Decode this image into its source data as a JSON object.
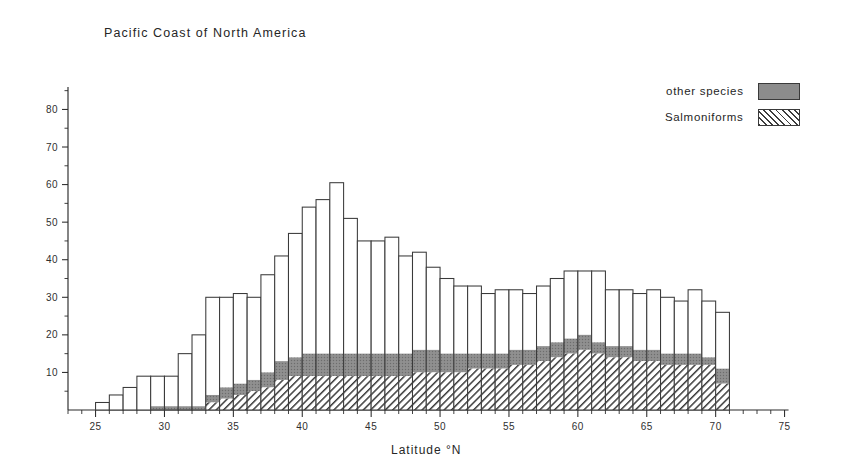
{
  "chart": {
    "title": "Pacific Coast of North America",
    "xlabel": "Latitude  °N",
    "ylabel": ""
  },
  "legend": {
    "position": "top-right",
    "items": [
      {
        "label": "other species",
        "swatch": "gray-solid-swatch",
        "color": "#8c8c8c"
      },
      {
        "label": "Salmoniforms",
        "swatch": "diagonal-hatch-swatch",
        "color": "#3c3c3c"
      }
    ]
  },
  "axes": {
    "x": {
      "min": 23,
      "max": 75,
      "tick_labels": [
        "25",
        "30",
        "35",
        "40",
        "45",
        "50",
        "55",
        "60",
        "65",
        "70",
        "75"
      ],
      "tick_values": [
        25,
        30,
        35,
        40,
        45,
        50,
        55,
        60,
        65,
        70,
        75
      ],
      "minor_step": 1
    },
    "y": {
      "min": 0,
      "max": 86,
      "tick_labels": [
        "10",
        "20",
        "30",
        "40",
        "50",
        "60",
        "70",
        "80"
      ],
      "tick_values": [
        10,
        20,
        30,
        40,
        50,
        60,
        70,
        80
      ],
      "minor_step": 5
    }
  },
  "chart_data": {
    "type": "bar",
    "subtype": "stacked-histogram",
    "title": "Pacific Coast of North America",
    "xlabel": "Latitude  °N",
    "ylabel": "",
    "xlim": [
      23,
      75
    ],
    "ylim": [
      0,
      86
    ],
    "grid": false,
    "bin_width": 1,
    "categories": [
      25,
      26,
      27,
      28,
      29,
      30,
      31,
      32,
      33,
      34,
      35,
      36,
      37,
      38,
      39,
      40,
      41,
      42,
      43,
      44,
      45,
      46,
      47,
      48,
      49,
      50,
      51,
      52,
      53,
      54,
      55,
      56,
      57,
      58,
      59,
      60,
      61,
      62,
      63,
      64,
      65,
      66,
      67,
      68,
      69,
      70
    ],
    "series": [
      {
        "name": "Salmoniforms",
        "fill": "diagonal-hatch",
        "color": "#3c3c3c",
        "values": [
          0,
          0,
          0,
          0,
          0,
          0,
          0,
          0,
          2,
          3,
          4,
          5,
          6,
          8,
          9,
          9,
          9,
          9,
          9,
          9,
          9,
          9,
          9,
          10,
          10,
          10,
          10,
          11,
          11,
          11,
          12,
          12,
          13,
          14,
          15,
          16,
          15,
          14,
          14,
          13,
          13,
          12,
          12,
          12,
          12,
          7
        ]
      },
      {
        "name": "other species",
        "fill": "gray-solid",
        "color": "#8c8c8c",
        "values": [
          0,
          0,
          0,
          0,
          1,
          1,
          1,
          1,
          2,
          3,
          3,
          3,
          4,
          5,
          5,
          6,
          6,
          6,
          6,
          6,
          6,
          6,
          6,
          6,
          6,
          5,
          5,
          4,
          4,
          4,
          4,
          4,
          4,
          4,
          4,
          4,
          3,
          3,
          3,
          3,
          3,
          3,
          3,
          3,
          2,
          4
        ]
      },
      {
        "name": "remainder (unfilled)",
        "fill": "white",
        "color": "#ffffff",
        "values": [
          2,
          4,
          6,
          9,
          8,
          8,
          14,
          19,
          26,
          24,
          24,
          22,
          26,
          28,
          33,
          39,
          41,
          45,
          36,
          30,
          30,
          31,
          26,
          26,
          22,
          20,
          18,
          18,
          16,
          17,
          16,
          15,
          16,
          17,
          18,
          17,
          19,
          15,
          15,
          15,
          16,
          15,
          14,
          17,
          15,
          15
        ]
      }
    ],
    "totals": [
      2,
      4,
      6,
      9,
      9,
      9,
      15,
      20,
      30,
      30,
      31,
      30,
      36,
      41,
      47,
      54,
      56,
      60.5,
      51,
      45,
      45,
      46,
      41,
      42,
      38,
      35,
      33,
      33,
      31,
      32,
      32,
      31,
      33,
      35,
      37,
      37,
      37,
      32,
      32,
      31,
      32,
      30,
      29,
      32,
      29,
      26
    ]
  }
}
